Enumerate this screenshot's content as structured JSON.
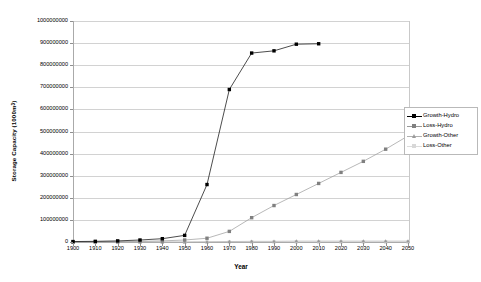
{
  "chart_data": {
    "type": "line",
    "title": "",
    "xlabel": "Year",
    "ylabel_text": "Storage Capacity (1000m",
    "ylabel_sup": "3",
    "ylabel_close": ")",
    "ylabel_full": "Storage Capacity (1000m3)",
    "xlim": [
      1900,
      2050
    ],
    "ylim": [
      0,
      1000000000
    ],
    "grid": true,
    "legend_position": "right",
    "x": [
      1900,
      1910,
      1920,
      1930,
      1940,
      1950,
      1960,
      1970,
      1980,
      1990,
      2000,
      2010,
      2020,
      2030,
      2040,
      2050
    ],
    "xtick_labels": [
      "1900",
      "1910",
      "1920",
      "1930",
      "1940",
      "1950",
      "1960",
      "1970",
      "1980",
      "1990",
      "2000",
      "2010",
      "2020",
      "2030",
      "2040",
      "2050"
    ],
    "ytick_labels": [
      "0",
      "100000000",
      "200000000",
      "300000000",
      "400000000",
      "500000000",
      "600000000",
      "700000000",
      "800000000",
      "900000000",
      "1000000000"
    ],
    "ytick_values": [
      0,
      100000000,
      200000000,
      300000000,
      400000000,
      500000000,
      600000000,
      700000000,
      800000000,
      900000000,
      1000000000
    ],
    "series": [
      {
        "name": "Growth-Hydro",
        "color": "#000000",
        "marker": "square",
        "marker_color": "#000000",
        "x": [
          1900,
          1910,
          1920,
          1930,
          1940,
          1950,
          1960,
          1970,
          1980,
          1990,
          2000,
          2010
        ],
        "values": [
          2000000,
          3000000,
          5000000,
          9000000,
          15000000,
          30000000,
          260000000,
          690000000,
          855000000,
          865000000,
          895000000,
          897000000
        ]
      },
      {
        "name": "Loss-Hydro",
        "color": "#999999",
        "marker": "square",
        "marker_color": "#808080",
        "x": [
          1900,
          1910,
          1920,
          1930,
          1940,
          1950,
          1960,
          1970,
          1980,
          1990,
          2000,
          2010,
          2020,
          2030,
          2040,
          2050
        ],
        "values": [
          0,
          1000000,
          2000000,
          3000000,
          5000000,
          9000000,
          17000000,
          48000000,
          110000000,
          165000000,
          215000000,
          265000000,
          315000000,
          365000000,
          420000000,
          480000000
        ]
      },
      {
        "name": "Growth-Other",
        "color": "#b0b0b0",
        "marker": "triangle",
        "marker_color": "#9a9a9a",
        "x": [
          1900,
          1910,
          1920,
          1930,
          1940,
          1950,
          1960,
          1970,
          1980,
          1990,
          2000,
          2010,
          2020,
          2030,
          2040,
          2050
        ],
        "values": [
          0,
          0,
          0,
          0,
          0,
          0,
          1000000,
          2000000,
          3000000,
          3000000,
          4000000,
          4000000,
          4000000,
          4000000,
          4000000,
          4000000
        ]
      },
      {
        "name": "Loss-Other",
        "color": "#dcdcdc",
        "marker": "square",
        "marker_color": "#d8d8d8",
        "x": [
          1900,
          1910,
          1920,
          1930,
          1940,
          1950,
          1960,
          1970,
          1980,
          1990,
          2000,
          2010,
          2020,
          2030,
          2040,
          2050
        ],
        "values": [
          0,
          0,
          0,
          0,
          0,
          0,
          0,
          0,
          0,
          0,
          0,
          0,
          0,
          0,
          0,
          0
        ]
      }
    ]
  },
  "legend": {
    "items": [
      {
        "label": "Growth-Hydro"
      },
      {
        "label": "Loss-Hydro"
      },
      {
        "label": "Growth-Other"
      },
      {
        "label": "Loss-Other"
      }
    ]
  }
}
